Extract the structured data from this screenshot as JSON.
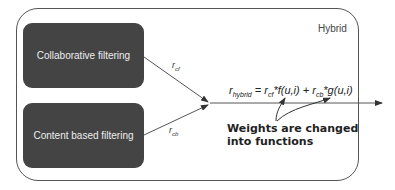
{
  "container": {
    "label": "Hybrid"
  },
  "boxes": {
    "collaborative": {
      "label": "Collaborative filtering"
    },
    "content": {
      "label": "Content based filtering"
    }
  },
  "edges": {
    "cf": {
      "var": "r",
      "sub": "cf"
    },
    "cb": {
      "var": "r",
      "sub": "cb"
    }
  },
  "formula": {
    "lhs_var": "r",
    "lhs_sub": "hybrid",
    "eq": " = ",
    "t1_var": "r",
    "t1_sub": "cf",
    "t1_fn": "*f(u,i)",
    "plus": " + ",
    "t2_var": "r",
    "t2_sub": "cb",
    "t2_fn": "*g(u,i)"
  },
  "annotation": {
    "line1": "Weights are changed",
    "line2": "into functions"
  },
  "colors": {
    "box_fill": "#444444",
    "box_text": "#eeeeee",
    "stroke": "#555555"
  }
}
